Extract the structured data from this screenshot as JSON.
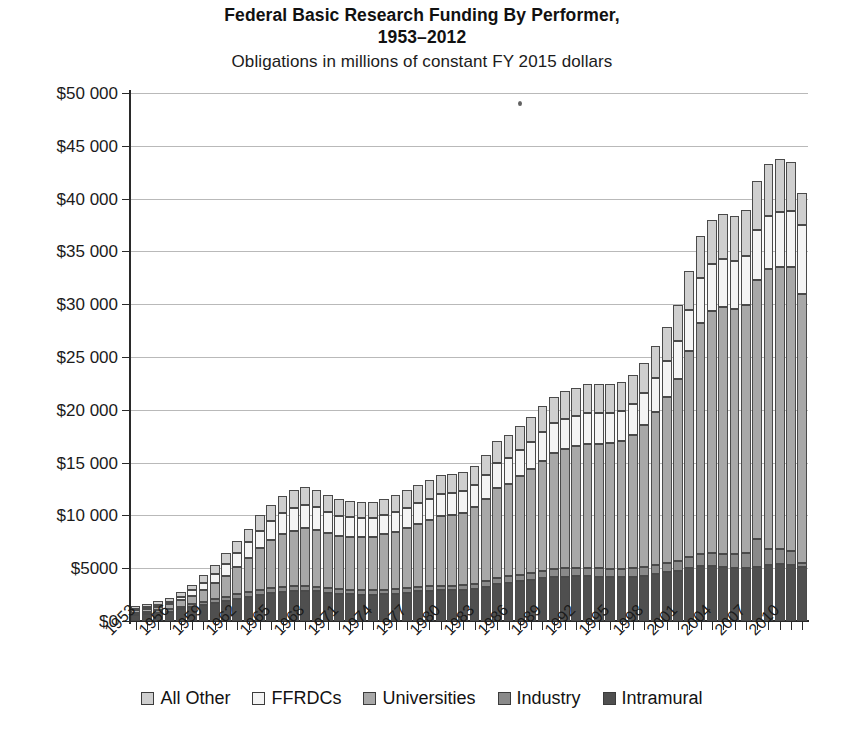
{
  "title": {
    "line1": "Federal Basic Research Funding By Performer,",
    "line2": "1953–2012",
    "subtitle": "Obligations in millions of constant FY 2015 dollars"
  },
  "legend": {
    "position": "bottom",
    "items": [
      {
        "label": "All Other",
        "color": "#cfcfcf"
      },
      {
        "label": "FFRDCs",
        "color": "#f4f4f4"
      },
      {
        "label": "Universities",
        "color": "#a8a8a8"
      },
      {
        "label": "Industry",
        "color": "#8a8a8a"
      },
      {
        "label": "Intramural",
        "color": "#4f4f4f"
      }
    ]
  },
  "axes": {
    "y_ticks": [
      "$0",
      "$5000",
      "$10 000",
      "$15 000",
      "$20 000",
      "$25 000",
      "$30 000",
      "$35 000",
      "$40 000",
      "$45 000",
      "$50 000"
    ],
    "x_ticks": [
      "1953",
      "1956",
      "1959",
      "1962",
      "1965",
      "1968",
      "1971",
      "1974",
      "1977",
      "1980",
      "1983",
      "1986",
      "1989",
      "1992",
      "1995",
      "1998",
      "2001",
      "2004",
      "2007",
      "2010"
    ]
  },
  "chart_data": {
    "type": "bar",
    "stacked": true,
    "title": "Federal Basic Research Funding By Performer, 1953–2012",
    "subtitle": "Obligations in millions of constant FY 2015 dollars",
    "xlabel": "",
    "ylabel": "Obligations in millions of constant FY 2015 dollars",
    "ylim": [
      0,
      50000
    ],
    "ytick_step": 5000,
    "grid": true,
    "legend_position": "bottom",
    "categories": [
      1953,
      1954,
      1955,
      1956,
      1957,
      1958,
      1959,
      1960,
      1961,
      1962,
      1963,
      1964,
      1965,
      1966,
      1967,
      1968,
      1969,
      1970,
      1971,
      1972,
      1973,
      1974,
      1975,
      1976,
      1977,
      1978,
      1979,
      1980,
      1981,
      1982,
      1983,
      1984,
      1985,
      1986,
      1987,
      1988,
      1989,
      1990,
      1991,
      1992,
      1993,
      1994,
      1995,
      1996,
      1997,
      1998,
      1999,
      2000,
      2001,
      2002,
      2003,
      2004,
      2005,
      2006,
      2007,
      2008,
      2009,
      2010,
      2011,
      2012
    ],
    "series": [
      {
        "name": "Intramural",
        "color": "#4f4f4f",
        "values": [
          600,
          700,
          800,
          900,
          1100,
          1300,
          1500,
          1700,
          1900,
          2100,
          2300,
          2500,
          2650,
          2750,
          2800,
          2850,
          2800,
          2700,
          2600,
          2550,
          2500,
          2500,
          2550,
          2600,
          2700,
          2800,
          2850,
          2900,
          2900,
          2950,
          3050,
          3250,
          3500,
          3600,
          3750,
          3900,
          4050,
          4150,
          4200,
          4250,
          4250,
          4200,
          4150,
          4150,
          4200,
          4300,
          4450,
          4600,
          4750,
          5000,
          5200,
          5200,
          5100,
          5050,
          5050,
          5150,
          5300,
          5400,
          5300,
          5100
        ]
      },
      {
        "name": "Industry",
        "color": "#8a8a8a",
        "values": [
          150,
          180,
          200,
          230,
          260,
          300,
          330,
          360,
          400,
          430,
          450,
          470,
          480,
          480,
          470,
          470,
          450,
          430,
          420,
          410,
          400,
          400,
          400,
          410,
          420,
          430,
          440,
          450,
          460,
          470,
          500,
          550,
          600,
          620,
          650,
          680,
          720,
          760,
          790,
          800,
          800,
          790,
          780,
          780,
          800,
          820,
          860,
          900,
          950,
          1050,
          1150,
          1200,
          1250,
          1300,
          1400,
          2600,
          1500,
          1450,
          1300,
          400
        ]
      },
      {
        "name": "Universities",
        "color": "#a8a8a8",
        "values": [
          250,
          300,
          350,
          450,
          600,
          800,
          1100,
          1500,
          2000,
          2600,
          3200,
          3900,
          4500,
          5000,
          5300,
          5500,
          5400,
          5200,
          5000,
          5000,
          5050,
          5100,
          5250,
          5450,
          5700,
          6000,
          6300,
          6600,
          6700,
          6800,
          7200,
          7800,
          8500,
          8800,
          9300,
          9800,
          10400,
          11000,
          11300,
          11500,
          11700,
          11800,
          11900,
          12100,
          12600,
          13400,
          14500,
          15700,
          17200,
          19500,
          21900,
          23000,
          23400,
          23200,
          23500,
          24500,
          26500,
          26700,
          26900,
          25500
        ]
      },
      {
        "name": "FFRDCs",
        "color": "#f4f4f4",
        "values": [
          150,
          180,
          200,
          250,
          350,
          500,
          700,
          900,
          1100,
          1300,
          1500,
          1700,
          1850,
          2000,
          2100,
          2150,
          2100,
          2000,
          1900,
          1850,
          1800,
          1800,
          1800,
          1850,
          1900,
          1950,
          2000,
          2050,
          2050,
          2050,
          2100,
          2200,
          2350,
          2400,
          2500,
          2600,
          2700,
          2800,
          2850,
          2900,
          2950,
          2950,
          2900,
          2900,
          2950,
          3050,
          3200,
          3400,
          3600,
          3900,
          4200,
          4400,
          4500,
          4500,
          4600,
          4800,
          5100,
          5200,
          5300,
          6500
        ]
      },
      {
        "name": "All Other",
        "color": "#cfcfcf",
        "values": [
          250,
          280,
          300,
          350,
          450,
          550,
          700,
          850,
          1000,
          1150,
          1300,
          1450,
          1550,
          1650,
          1700,
          1750,
          1700,
          1650,
          1600,
          1550,
          1500,
          1500,
          1550,
          1600,
          1650,
          1700,
          1750,
          1800,
          1800,
          1800,
          1850,
          1950,
          2100,
          2150,
          2250,
          2350,
          2450,
          2550,
          2600,
          2650,
          2700,
          2700,
          2700,
          2700,
          2750,
          2850,
          3000,
          3200,
          3400,
          3700,
          4000,
          4200,
          4300,
          4300,
          4400,
          4600,
          4900,
          5000,
          4700,
          3000
        ]
      }
    ]
  },
  "artifacts": {
    "speck_note": "scan speck"
  }
}
